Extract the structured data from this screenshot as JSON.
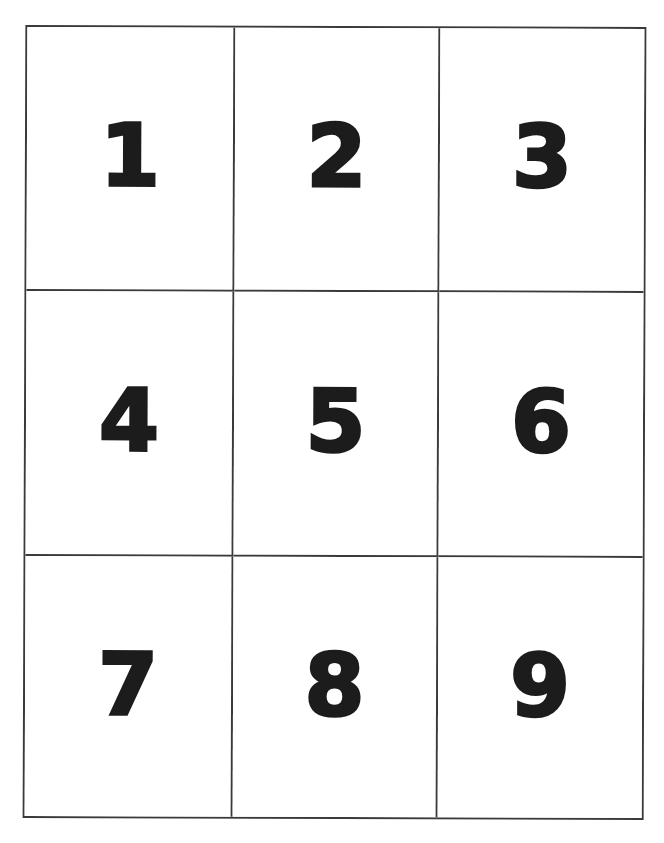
{
  "document": {
    "type": "number-cards-sheet",
    "grid": {
      "rows": 3,
      "columns": 3,
      "line_color": "#3a3a3a",
      "digit_color": "#1c1c1c",
      "background": "#ffffff"
    },
    "cells": [
      {
        "row": 0,
        "col": 0,
        "label": "1"
      },
      {
        "row": 0,
        "col": 1,
        "label": "2"
      },
      {
        "row": 0,
        "col": 2,
        "label": "3"
      },
      {
        "row": 1,
        "col": 0,
        "label": "4"
      },
      {
        "row": 1,
        "col": 1,
        "label": "5"
      },
      {
        "row": 1,
        "col": 2,
        "label": "6"
      },
      {
        "row": 2,
        "col": 0,
        "label": "7"
      },
      {
        "row": 2,
        "col": 1,
        "label": "8"
      },
      {
        "row": 2,
        "col": 2,
        "label": "9"
      }
    ]
  }
}
